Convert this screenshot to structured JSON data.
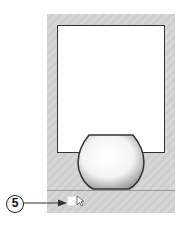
{
  "callout": {
    "number": "5"
  },
  "colors": {
    "panel_bg": "#d3d3d3",
    "border": "#333333",
    "separator": "#9a9a9a"
  },
  "icons": {
    "cursor": "pointer-cursor-icon",
    "tool": "shape-tool-icon",
    "object": "sphere-object-icon"
  }
}
